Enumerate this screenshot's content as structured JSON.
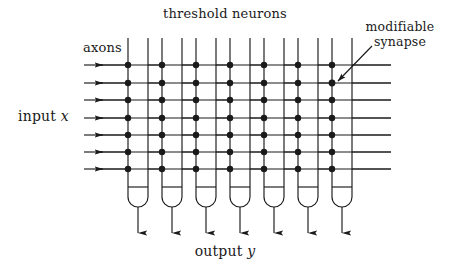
{
  "figure": {
    "width": 450,
    "height": 272,
    "background": "#ffffff",
    "ink": "#1a1a1a",
    "title": "threshold neurons"
  },
  "labels": {
    "threshold_neurons": "threshold neurons",
    "axons": "axons",
    "input_prefix": "input ",
    "input_symbol": "x",
    "output_prefix": "output ",
    "output_symbol": "y",
    "modifiable_synapse_line1": "modifiable",
    "modifiable_synapse_line2": "synapse"
  },
  "diagram_data": {
    "type": "schematic",
    "description": "Grid of seven vertical threshold-neuron dendrite bodies crossed by seven horizontal input axon lines, with filled-circle modifiable synapses at every crossing.",
    "neuron_count": 7,
    "axon_count": 7,
    "synapse_count": 49,
    "neuron_columns_x_left": [
      128,
      162,
      196,
      230,
      264,
      298,
      332
    ],
    "neuron_column_width": 20,
    "neuron_body_top_y": 38,
    "neuron_threshold_bar_y": 187,
    "neuron_body_bottom_y": 207,
    "neuron_axon_out_end_y": 233,
    "axon_rows_y": [
      65,
      83,
      100,
      118,
      135,
      152,
      169
    ],
    "axon_arrow_start_x": 84,
    "axon_line_end_x": 391,
    "synapse_dot_radius": 3.2,
    "annotation": {
      "target_column_index": 6,
      "target_row_index": 1,
      "leader_from_x": 372,
      "leader_from_y": 46,
      "leader_to_x": 339,
      "leader_to_y": 80
    }
  }
}
